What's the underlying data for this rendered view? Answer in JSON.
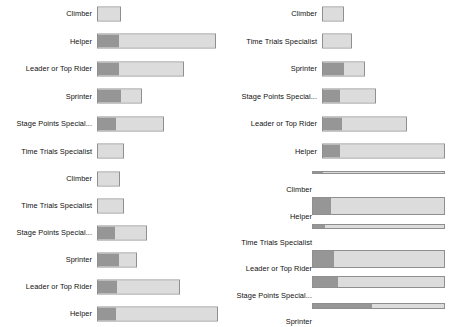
{
  "chart_data": [
    {
      "id": "panel-1",
      "type": "bar",
      "orientation": "horizontal",
      "stacked": true,
      "title": "",
      "xlabel": "",
      "ylabel": "",
      "grid": false,
      "legend": "none",
      "categories": [
        "Climber",
        "Helper",
        "Leader or Top Rider",
        "Sprinter",
        "Stage Points Special...",
        "Time Trials Specialist"
      ],
      "series": [
        {
          "name": "segment-dark",
          "color": "#969696",
          "values": [
            0,
            18,
            18,
            20,
            16,
            0
          ]
        },
        {
          "name": "segment-light",
          "color": "#dcdcdc",
          "values": [
            20,
            82,
            55,
            18,
            40,
            23
          ]
        }
      ],
      "totals": [
        20,
        100,
        73,
        38,
        56,
        23
      ],
      "xlim": [
        0,
        100
      ]
    },
    {
      "id": "panel-2",
      "type": "bar",
      "orientation": "horizontal",
      "stacked": true,
      "title": "",
      "xlabel": "",
      "ylabel": "",
      "grid": false,
      "legend": "none",
      "categories": [
        "Climber",
        "Time Trials Specialist",
        "Sprinter",
        "Stage Points Special...",
        "Leader or Top Rider",
        "Helper"
      ],
      "series": [
        {
          "name": "segment-dark",
          "color": "#969696",
          "values": [
            0,
            0,
            18,
            14,
            16,
            14
          ]
        },
        {
          "name": "segment-light",
          "color": "#dcdcdc",
          "values": [
            18,
            24,
            17,
            30,
            53,
            86
          ]
        }
      ],
      "totals": [
        18,
        24,
        35,
        44,
        69,
        100
      ],
      "xlim": [
        0,
        100
      ]
    },
    {
      "id": "panel-3",
      "type": "bar",
      "orientation": "horizontal",
      "stacked": true,
      "title": "",
      "xlabel": "",
      "ylabel": "",
      "grid": false,
      "legend": "none",
      "categories": [
        "Climber",
        "Time Trials Specialist",
        "Stage Points Special...",
        "Sprinter",
        "Leader or Top Rider",
        "Helper"
      ],
      "series": [
        {
          "name": "segment-dark",
          "color": "#969696",
          "values": [
            0,
            0,
            15,
            18,
            16,
            15
          ]
        },
        {
          "name": "segment-light",
          "color": "#dcdcdc",
          "values": [
            19,
            22,
            26,
            15,
            53,
            85
          ]
        }
      ],
      "totals": [
        19,
        22,
        41,
        33,
        69,
        100
      ],
      "xlim": [
        0,
        100
      ]
    },
    {
      "id": "panel-4",
      "type": "bar",
      "orientation": "horizontal",
      "stacked": true,
      "title": "",
      "xlabel": "",
      "ylabel": "",
      "grid": false,
      "legend": "none",
      "render_note": "bar-heights-collapsed",
      "categories": [
        "Climber",
        "Helper",
        "Time Trials Specialist",
        "Leader or Top Rider",
        "Stage Points Special...",
        "Sprinter"
      ],
      "series": [
        {
          "name": "segment-dark",
          "color": "#969696",
          "values": [
            8,
            14,
            9,
            16,
            19,
            45
          ]
        },
        {
          "name": "segment-light",
          "color": "#dcdcdc",
          "values": [
            92,
            86,
            91,
            84,
            81,
            55
          ]
        }
      ],
      "totals": [
        100,
        100,
        100,
        100,
        100,
        100
      ],
      "bar_heights_px": [
        3,
        18,
        5,
        18,
        12,
        6
      ],
      "xlim": [
        0,
        100
      ]
    }
  ],
  "colors": {
    "segment_dark": "#969696",
    "segment_light": "#dcdcdc",
    "bar_border": "#8f8f8f",
    "background": "#ffffff",
    "label_text": "#111111"
  }
}
